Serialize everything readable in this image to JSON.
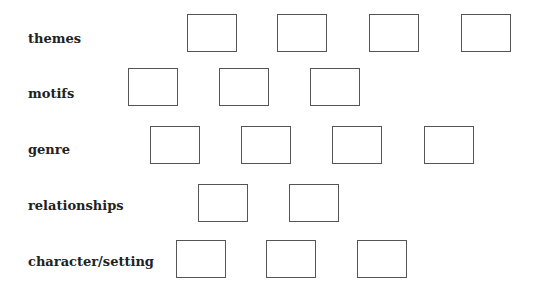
{
  "rows": [
    {
      "label": "themes",
      "label_top": 31,
      "boxes": [
        {
          "x": 187,
          "y": 14
        },
        {
          "x": 277,
          "y": 14
        },
        {
          "x": 369,
          "y": 14
        },
        {
          "x": 461,
          "y": 14
        }
      ]
    },
    {
      "label": "motifs",
      "label_top": 86,
      "boxes": [
        {
          "x": 128,
          "y": 68
        },
        {
          "x": 219,
          "y": 68
        },
        {
          "x": 310,
          "y": 68
        }
      ]
    },
    {
      "label": "genre",
      "label_top": 142,
      "boxes": [
        {
          "x": 150,
          "y": 126
        },
        {
          "x": 241,
          "y": 126
        },
        {
          "x": 332,
          "y": 126
        },
        {
          "x": 424,
          "y": 126
        }
      ]
    },
    {
      "label": "relationships",
      "label_top": 198,
      "boxes": [
        {
          "x": 198,
          "y": 184
        },
        {
          "x": 289,
          "y": 184
        }
      ]
    },
    {
      "label": "character/setting",
      "label_top": 254,
      "boxes": [
        {
          "x": 176,
          "y": 240
        },
        {
          "x": 266,
          "y": 240
        },
        {
          "x": 357,
          "y": 240
        }
      ]
    }
  ],
  "colors": {
    "box_border": "#555555",
    "label": "#222222",
    "background": "#ffffff"
  }
}
